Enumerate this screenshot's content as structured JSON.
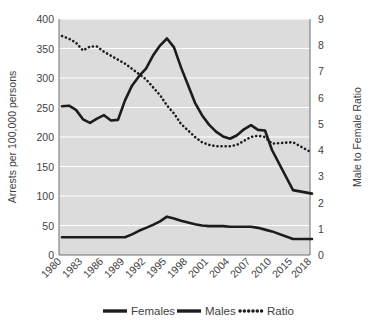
{
  "chart_data": {
    "type": "line",
    "title": "",
    "xlabel": "",
    "ylabel": "Arrests per 100,000 persons",
    "y2label": "Male to Female Ratio",
    "categories": [
      "1980",
      "1983",
      "1986",
      "1989",
      "1992",
      "1995",
      "1998",
      "2001",
      "2004",
      "2007",
      "2010",
      "2015",
      "2018"
    ],
    "x_tick_labels": [
      "1980",
      "1983",
      "1986",
      "1989",
      "1992",
      "1995",
      "1998",
      "2001",
      "2004",
      "2007",
      "2010",
      "2015",
      "2018"
    ],
    "ylim": [
      0,
      400
    ],
    "y_ticks": [
      0,
      50,
      100,
      150,
      200,
      250,
      300,
      350,
      400
    ],
    "y_tick_labels": [
      "0",
      "50",
      "100",
      "150",
      "200",
      "250",
      "300",
      "350",
      "400"
    ],
    "y2lim": [
      0,
      9
    ],
    "y2_ticks": [
      0,
      1,
      2,
      3,
      4,
      5,
      6,
      7,
      8,
      9
    ],
    "y2_tick_labels": [
      "0",
      "1",
      "2",
      "3",
      "4",
      "5",
      "6",
      "7",
      "8",
      "9"
    ],
    "grid": true,
    "legend_position": "bottom",
    "series": [
      {
        "name": "Females",
        "axis": "left",
        "style": "solid",
        "x": [
          "1980",
          "1981",
          "1982",
          "1983",
          "1984",
          "1985",
          "1986",
          "1987",
          "1988",
          "1989",
          "1990",
          "1991",
          "1992",
          "1993",
          "1994",
          "1995",
          "1996",
          "1997",
          "1998",
          "1999",
          "2000",
          "2001",
          "2002",
          "2003",
          "2004",
          "2005",
          "2006",
          "2007",
          "2008",
          "2009",
          "2010",
          "2015",
          "2018"
        ],
        "values": [
          30,
          30,
          30,
          30,
          30,
          30,
          30,
          30,
          30,
          30,
          35,
          41,
          46,
          51,
          57,
          65,
          62,
          58,
          55,
          52,
          50,
          49,
          49,
          49,
          48,
          48,
          48,
          48,
          46,
          43,
          40,
          27,
          27
        ]
      },
      {
        "name": "Males",
        "axis": "left",
        "style": "solid",
        "x": [
          "1980",
          "1981",
          "1982",
          "1983",
          "1984",
          "1985",
          "1986",
          "1987",
          "1988",
          "1989",
          "1990",
          "1991",
          "1992",
          "1993",
          "1994",
          "1995",
          "1996",
          "1997",
          "1998",
          "1999",
          "2000",
          "2001",
          "2002",
          "2003",
          "2004",
          "2005",
          "2006",
          "2007",
          "2008",
          "2009",
          "2010",
          "2015",
          "2018"
        ],
        "values": [
          252,
          253,
          246,
          230,
          224,
          231,
          237,
          228,
          229,
          262,
          287,
          303,
          316,
          338,
          355,
          367,
          352,
          318,
          288,
          258,
          237,
          221,
          209,
          201,
          197,
          203,
          213,
          220,
          212,
          211,
          178,
          110,
          104
        ]
      },
      {
        "name": "Ratio",
        "axis": "right",
        "style": "dotted",
        "x": [
          "1980",
          "1981",
          "1982",
          "1983",
          "1984",
          "1985",
          "1986",
          "1987",
          "1988",
          "1989",
          "1990",
          "1991",
          "1992",
          "1993",
          "1994",
          "1995",
          "1996",
          "1997",
          "1998",
          "1999",
          "2000",
          "2001",
          "2002",
          "2003",
          "2004",
          "2005",
          "2006",
          "2007",
          "2008",
          "2009",
          "2010",
          "2015",
          "2018"
        ],
        "values": [
          8.35,
          8.25,
          8.1,
          7.8,
          7.95,
          7.95,
          7.75,
          7.6,
          7.45,
          7.3,
          7.1,
          6.9,
          6.7,
          6.4,
          6.1,
          5.7,
          5.4,
          5.0,
          4.75,
          4.5,
          4.3,
          4.2,
          4.15,
          4.15,
          4.15,
          4.2,
          4.35,
          4.5,
          4.55,
          4.5,
          4.25,
          4.2,
          4.0
        ],
        "values_detail": [
          8.35,
          8.25,
          8.1,
          7.8,
          7.95,
          7.95,
          7.75,
          7.6,
          7.45,
          7.3,
          7.1,
          6.9,
          6.7,
          6.4,
          6.1,
          5.7,
          5.4,
          5.0,
          4.75,
          4.5,
          4.3,
          4.2,
          4.15,
          4.15,
          4.15,
          4.2,
          4.35,
          4.5,
          4.55,
          4.5,
          4.25,
          4.3,
          3.9
        ]
      }
    ],
    "legend_entries": [
      {
        "label": "Females",
        "style": "solid"
      },
      {
        "label": "Males",
        "style": "solid"
      },
      {
        "label": "Ratio",
        "style": "dotted"
      }
    ],
    "colors": {
      "plot_background": "#dcdcdc",
      "gridline": "#ffffff",
      "series_line": "#1c1c1c",
      "axis_text": "#3f3f3f",
      "page_background": "#ffffff"
    }
  }
}
